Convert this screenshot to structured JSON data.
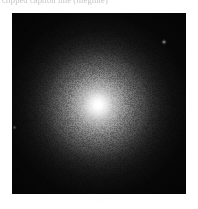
{
  "figure": {
    "width_px": 198,
    "height_px": 209,
    "background_color": "#ffffff"
  },
  "caption": {
    "text": "clipped caption line (illegible)",
    "color": "#b9b9bd",
    "position": "top",
    "clipped": "true"
  },
  "image_panel": {
    "label": "astronomical-image",
    "x_px": 12,
    "y_px": 13,
    "width_px": 174,
    "height_px": 181,
    "background_color": "#050505",
    "colormap": "grayscale",
    "description": "Radially symmetric extended source with bright unresolved core and smooth outward brightness falloff to near-black sky background; visible detector noise grain.",
    "object": {
      "name": "central-extended-source",
      "center_x_px": 98,
      "center_y_px": 105,
      "peak_color": "#ffffff",
      "halo_outer_color": "#b0b0b0",
      "halo_mid_color": "#d6d6d6",
      "halo_inner_color": "#f0f0f0",
      "sky_background_color": "#060606"
    },
    "field_sources": [
      {
        "name": "point-source-1",
        "x_px": 164,
        "y_px": 42,
        "brightness": "faint"
      },
      {
        "name": "point-source-2",
        "x_px": 14,
        "y_px": 128,
        "brightness": "very-faint"
      }
    ]
  },
  "footer": {
    "mark": "·",
    "color": "#dcdcdc"
  }
}
